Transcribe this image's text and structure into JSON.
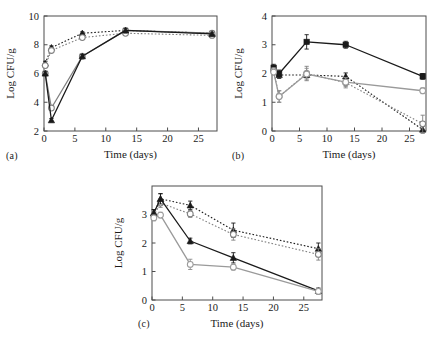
{
  "figure": {
    "panel_count": 3,
    "shared_xlabel": "Time (days)",
    "shared_ylabel": "Log CFU/g"
  },
  "panels": [
    {
      "tag": "(a)"
    },
    {
      "tag": "(b)"
    },
    {
      "tag": "(c)"
    }
  ],
  "chart_data": [
    {
      "type": "line",
      "panel": "(a)",
      "title": "",
      "xlabel": "Time (days)",
      "ylabel": "Log CFU/g",
      "xlim": [
        0,
        28
      ],
      "ylim": [
        2,
        10
      ],
      "xticks": [
        0,
        5,
        10,
        15,
        20,
        25
      ],
      "yticks": [
        2,
        4,
        6,
        8,
        10
      ],
      "grid": false,
      "legend": "none",
      "x": [
        0.2,
        1.2,
        6.2,
        13.2,
        27.2
      ],
      "series": [
        {
          "name": "dotted-filled-triangle",
          "marker": "filled-triangle",
          "line": "dotted",
          "color": "#1a1a1a",
          "values": [
            6.7,
            7.8,
            8.8,
            9.0,
            8.8
          ],
          "errors": [
            0.15,
            0.12,
            0.1,
            0.12,
            0.12
          ]
        },
        {
          "name": "dotted-open-circle",
          "marker": "open-circle",
          "line": "dotted",
          "color": "#808080",
          "values": [
            6.55,
            7.6,
            8.5,
            8.8,
            8.65
          ],
          "errors": [
            0.15,
            0.12,
            0.1,
            0.12,
            0.12
          ]
        },
        {
          "name": "solid-open-circle",
          "marker": "open-circle",
          "line": "solid",
          "color": "#808080",
          "values": [
            6.0,
            3.6,
            7.2,
            9.0,
            8.8
          ],
          "errors": [
            0.12,
            0.15,
            0.12,
            0.12,
            0.12
          ]
        },
        {
          "name": "solid-filled-triangle",
          "marker": "filled-triangle",
          "line": "solid",
          "color": "#1a1a1a",
          "values": [
            6.0,
            2.75,
            7.2,
            9.0,
            8.75
          ],
          "errors": [
            0.12,
            0.12,
            0.12,
            0.12,
            0.12
          ]
        }
      ]
    },
    {
      "type": "line",
      "panel": "(b)",
      "title": "",
      "xlabel": "Time (days)",
      "ylabel": "Log CFU/g",
      "xlim": [
        0,
        28
      ],
      "ylim": [
        0,
        4
      ],
      "xticks": [
        0,
        5,
        10,
        15,
        20,
        25
      ],
      "yticks": [
        0,
        1,
        2,
        3,
        4
      ],
      "grid": false,
      "legend": "none",
      "x": [
        0.3,
        1.3,
        6.3,
        13.4,
        27.4
      ],
      "series": [
        {
          "name": "solid-filled-square",
          "marker": "filled-square",
          "line": "solid",
          "color": "#1a1a1a",
          "values": [
            2.2,
            2.0,
            3.1,
            3.0,
            1.9
          ],
          "errors": [
            0.12,
            0.12,
            0.25,
            0.12,
            0.1
          ]
        },
        {
          "name": "dotted-filled-triangle",
          "marker": "filled-triangle",
          "line": "dotted",
          "color": "#1a1a1a",
          "values": [
            2.15,
            1.95,
            1.95,
            1.9,
            0.05
          ],
          "errors": [
            0.1,
            0.12,
            0.1,
            0.12,
            0.12
          ]
        },
        {
          "name": "dotted-open-circle",
          "marker": "open-circle",
          "line": "dotted",
          "color": "#808080",
          "values": [
            2.1,
            1.2,
            2.0,
            1.68,
            0.25
          ],
          "errors": [
            0.1,
            0.2,
            0.25,
            0.18,
            0.3
          ]
        },
        {
          "name": "solid-open-circle",
          "marker": "open-circle",
          "line": "solid",
          "color": "#9a9a9a",
          "values": [
            2.05,
            1.2,
            1.98,
            1.7,
            1.4
          ],
          "errors": [
            0.1,
            0.2,
            0.2,
            0.15,
            0.1
          ]
        }
      ]
    },
    {
      "type": "line",
      "panel": "(c)",
      "title": "",
      "xlabel": "Time (days)",
      "ylabel": "Log CFU/g",
      "xlim": [
        0,
        28
      ],
      "ylim": [
        0,
        4
      ],
      "xticks": [
        0,
        5,
        10,
        15,
        20,
        25
      ],
      "yticks": [
        0,
        1,
        2,
        3
      ],
      "grid": false,
      "legend": "none",
      "x": [
        0.3,
        1.4,
        6.3,
        13.4,
        27.4
      ],
      "series": [
        {
          "name": "dotted-filled-triangle",
          "marker": "filled-triangle",
          "line": "dotted",
          "color": "#1a1a1a",
          "values": [
            3.05,
            3.55,
            3.32,
            2.45,
            1.8
          ],
          "errors": [
            0.12,
            0.18,
            0.15,
            0.25,
            0.2
          ]
        },
        {
          "name": "dotted-open-circle",
          "marker": "open-circle",
          "line": "dotted",
          "color": "#808080",
          "values": [
            2.95,
            3.4,
            3.02,
            2.3,
            1.6
          ],
          "errors": [
            0.12,
            0.15,
            0.12,
            0.2,
            0.2
          ]
        },
        {
          "name": "solid-filled-triangle",
          "marker": "filled-triangle",
          "line": "solid",
          "color": "#1a1a1a",
          "values": [
            3.05,
            3.55,
            2.07,
            1.48,
            0.32
          ],
          "errors": [
            0.12,
            0.18,
            0.1,
            0.18,
            0.1
          ]
        },
        {
          "name": "solid-open-circle",
          "marker": "open-circle",
          "line": "solid",
          "color": "#9a9a9a",
          "values": [
            2.88,
            2.98,
            1.25,
            1.15,
            0.3
          ],
          "errors": [
            0.1,
            0.1,
            0.18,
            0.1,
            0.1
          ]
        }
      ]
    }
  ]
}
